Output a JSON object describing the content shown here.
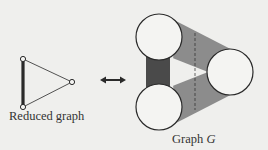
{
  "reduced_graph": {
    "label": "Reduced graph",
    "vertices": [
      {
        "id": "top",
        "x": 23,
        "y": 59
      },
      {
        "id": "bottom",
        "x": 23,
        "y": 107
      },
      {
        "id": "right",
        "x": 72,
        "y": 82
      }
    ],
    "edges": [
      {
        "from": "top",
        "to": "bottom",
        "style": "thick"
      },
      {
        "from": "top",
        "to": "right",
        "style": "thin"
      },
      {
        "from": "bottom",
        "to": "right",
        "style": "thin"
      }
    ]
  },
  "relation_arrow": {
    "icon": "double-headed-arrow-icon"
  },
  "graph_g": {
    "label_prefix": "Graph ",
    "label_var": "G",
    "clusters": [
      {
        "id": "top",
        "cx": 159,
        "cy": 37,
        "r": 23
      },
      {
        "id": "bottom",
        "cx": 159,
        "cy": 107,
        "r": 23
      },
      {
        "id": "right",
        "cx": 230,
        "cy": 72,
        "r": 23
      }
    ],
    "bands": [
      {
        "from": "top",
        "to": "bottom",
        "shade": "dark"
      },
      {
        "from": "top",
        "to": "right",
        "shade": "medium"
      },
      {
        "from": "bottom",
        "to": "right",
        "shade": "medium"
      }
    ],
    "cut_line": {
      "style": "dashed",
      "x": 195
    }
  },
  "colors": {
    "background": "#efefed",
    "stroke": "#2a2a2a",
    "band_dark": "#4a4a4a",
    "band_medium": "#8c8c8c",
    "circle_fill": "#f4f4f2"
  }
}
